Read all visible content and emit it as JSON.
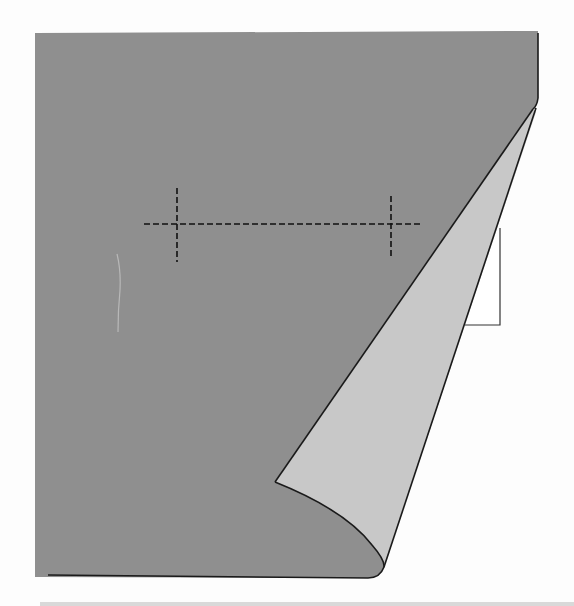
{
  "diagram": {
    "colors": {
      "background": "#fdfdfd",
      "page_front": "#8f8f8f",
      "page_back": "#c8c8c8",
      "outline": "#1a1a1a",
      "under_sheet": "#ffffff",
      "dash": "#111111"
    },
    "elements": {
      "page": {
        "label": ""
      },
      "curl": {
        "label": ""
      },
      "under_sheet": {
        "label": ""
      },
      "guide_line": {
        "label": ""
      },
      "tick_left": {
        "label": ""
      },
      "tick_right": {
        "label": ""
      }
    }
  }
}
